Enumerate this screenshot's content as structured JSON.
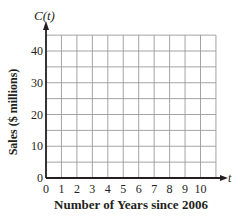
{
  "chart_data": {
    "type": "line",
    "title": "",
    "function_label": "C(t)",
    "xlabel": "Number of Years since 2006",
    "ylabel": "Sales ($ millions)",
    "x_axis_var": "t",
    "x_ticks": [
      0,
      1,
      2,
      3,
      4,
      5,
      6,
      7,
      8,
      9,
      10
    ],
    "y_ticks": [
      0,
      10,
      20,
      30,
      40
    ],
    "x_grid_step": 1,
    "y_grid_step": 5,
    "xlim": [
      0,
      11
    ],
    "ylim": [
      0,
      45
    ],
    "grid": true,
    "legend": null,
    "series": []
  },
  "colors": {
    "axis": "#231f20",
    "grid": "#9a9a9a",
    "text": "#231f20"
  }
}
